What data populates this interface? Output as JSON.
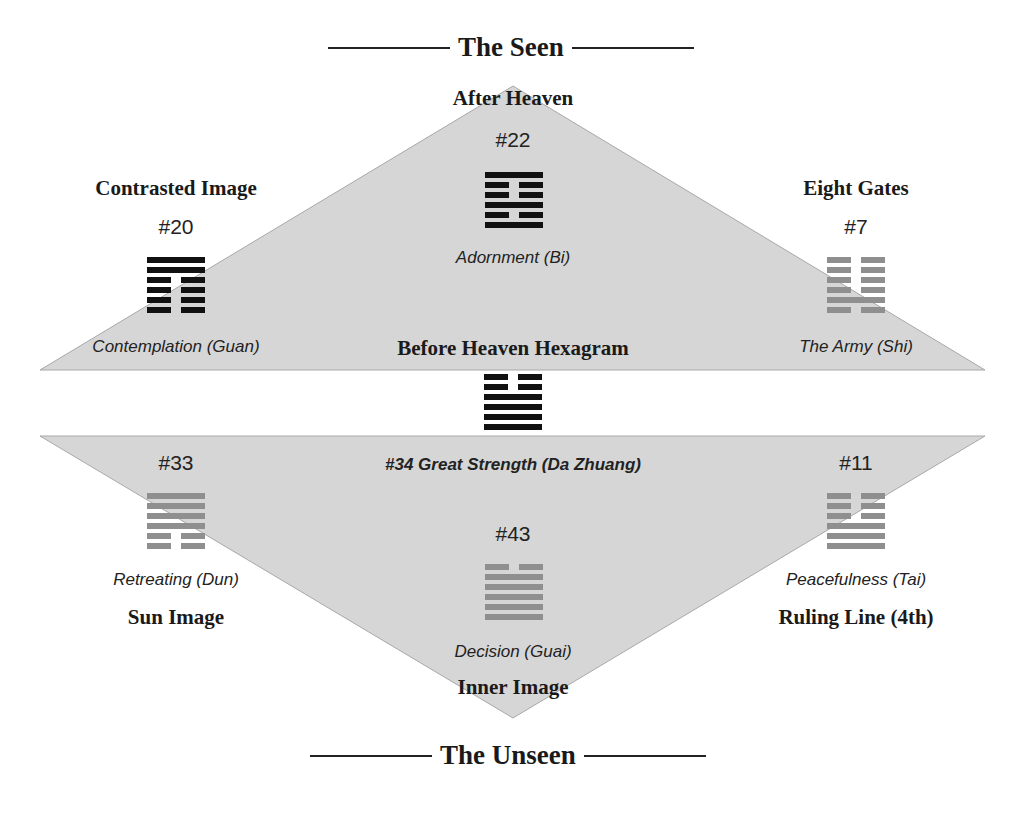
{
  "colors": {
    "triangle_fill": "#d6d6d6",
    "triangle_edge": "#a8a8a8",
    "hex_black": "#111111",
    "hex_gray": "#8f8f8f"
  },
  "top_cut_text": "",
  "header": {
    "title": "The Seen"
  },
  "footer": {
    "title": "The Unseen"
  },
  "center": {
    "before_heaven_label": "Before Heaven Hexagram",
    "hexagram": {
      "name": "#34 Great Strength (Da Zhuang)",
      "lines_top_to_bottom": [
        "broken",
        "broken",
        "solid",
        "solid",
        "solid",
        "solid"
      ],
      "tone": "black"
    }
  },
  "positions": {
    "after_heaven": {
      "role": "After Heaven",
      "number": "#22",
      "name": "Adornment (Bi)",
      "lines_top_to_bottom": [
        "solid",
        "broken",
        "broken",
        "solid",
        "broken",
        "solid"
      ],
      "tone": "black"
    },
    "contrasted_image": {
      "role": "Contrasted Image",
      "number": "#20",
      "name": "Contemplation (Guan)",
      "lines_top_to_bottom": [
        "solid",
        "solid",
        "broken",
        "broken",
        "broken",
        "broken"
      ],
      "tone": "black"
    },
    "eight_gates": {
      "role": "Eight Gates",
      "number": "#7",
      "name": "The Army (Shi)",
      "lines_top_to_bottom": [
        "broken",
        "broken",
        "broken",
        "broken",
        "solid",
        "broken"
      ],
      "tone": "gray"
    },
    "sun_image": {
      "role": "Sun Image",
      "number": "#33",
      "name": "Retreating (Dun)",
      "lines_top_to_bottom": [
        "solid",
        "solid",
        "solid",
        "solid",
        "broken",
        "broken"
      ],
      "tone": "gray"
    },
    "inner_image": {
      "role": "Inner Image",
      "number": "#43",
      "name": "Decision (Guai)",
      "lines_top_to_bottom": [
        "broken",
        "solid",
        "solid",
        "solid",
        "solid",
        "solid"
      ],
      "tone": "gray"
    },
    "ruling_line": {
      "role": "Ruling Line (4th)",
      "number": "#11",
      "name": "Peacefulness (Tai)",
      "lines_top_to_bottom": [
        "broken",
        "broken",
        "broken",
        "solid",
        "solid",
        "solid"
      ],
      "tone": "gray"
    }
  }
}
